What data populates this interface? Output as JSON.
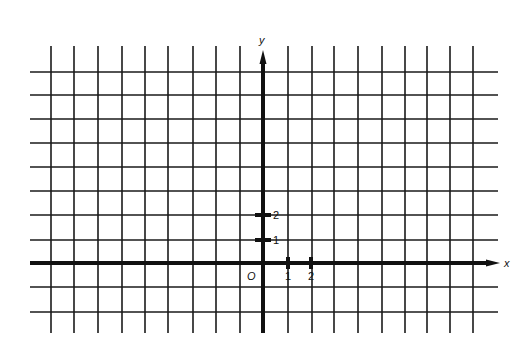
{
  "diagram": {
    "type": "coordinate-grid",
    "colors": {
      "background": "#ffffff",
      "grid": "#1a1a1a",
      "axis": "#111111"
    },
    "grid": {
      "vertical_x": [
        51,
        74,
        98,
        122,
        145,
        168,
        193,
        216,
        240,
        288,
        312,
        334,
        358,
        382,
        405,
        427,
        450,
        473
      ],
      "horizontal_y": [
        72,
        95,
        119,
        143,
        167,
        191,
        215,
        240,
        287,
        312
      ],
      "x_start": 30,
      "x_end": 498,
      "y_start": 46,
      "y_end": 333
    },
    "axes": {
      "x_axis": {
        "label": "x",
        "y": 263,
        "from": 30,
        "to": 500
      },
      "y_axis": {
        "label": "y",
        "x": 263,
        "from": 333,
        "to": 50
      },
      "origin_label": "O"
    },
    "ticks": {
      "x": [
        {
          "label": "1",
          "x": 288
        },
        {
          "label": "2",
          "x": 311
        }
      ],
      "y": [
        {
          "label": "1",
          "y": 240
        },
        {
          "label": "2",
          "y": 215
        }
      ]
    }
  }
}
